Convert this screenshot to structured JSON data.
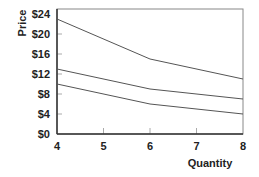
{
  "chart_data": {
    "type": "line",
    "title": "",
    "xlabel": "Quantity",
    "ylabel": "Price",
    "x": [
      4,
      6,
      8
    ],
    "series": [
      {
        "name": "upper",
        "values": [
          23,
          15,
          11
        ]
      },
      {
        "name": "middle",
        "values": [
          13,
          9,
          7
        ]
      },
      {
        "name": "lower",
        "values": [
          10,
          6,
          4
        ]
      }
    ],
    "xlim": [
      4,
      8
    ],
    "ylim": [
      0,
      24
    ],
    "x_ticks": [
      "4",
      "5",
      "6",
      "7",
      "8"
    ],
    "y_ticks": [
      "$0",
      "$4",
      "$8",
      "$12",
      "$16",
      "$20",
      "$24"
    ],
    "grid": false,
    "legend": "none",
    "colors": {
      "lines": "#555555",
      "axis": "#333333",
      "frame": "#888888"
    }
  }
}
